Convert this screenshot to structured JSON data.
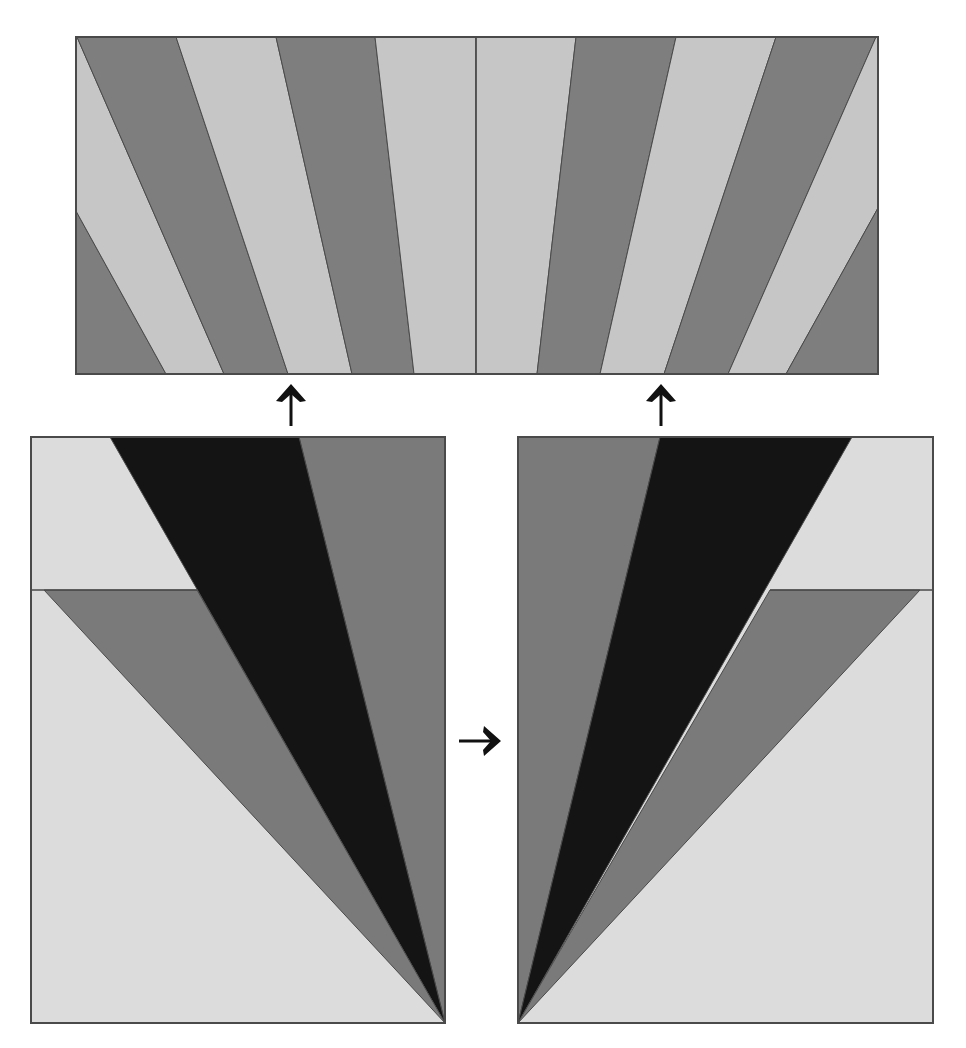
{
  "diagram": {
    "colors": {
      "background": "#ffffff",
      "stripe_light": "#c6c6c6",
      "stripe_dark": "#7e7e7e",
      "block_light": "#dcdcdc",
      "block_mid": "#7a7a7a",
      "block_black": "#141414",
      "outline": "#4a4a4a",
      "arrow": "#111111"
    },
    "top_panel": {
      "name": "sunburst-strip",
      "x": 76,
      "y": 37,
      "width": 802,
      "height": 337,
      "center_line_x": 476,
      "stripes": [
        {
          "tone": "dark",
          "points": "76,211 166,374 76,374"
        },
        {
          "tone": "light",
          "points": "76,37 77,37 224,374 166,374 76,211"
        },
        {
          "tone": "dark",
          "points": "77,37 176,37 288,374 224,374"
        },
        {
          "tone": "light",
          "points": "176,37 276,37 352,374 288,374"
        },
        {
          "tone": "dark",
          "points": "276,37 375,37 414,374 352,374"
        },
        {
          "tone": "light",
          "points": "375,37 476,37 476,374 414,374"
        },
        {
          "tone": "light",
          "points": "476,37 576,37 537,374 476,374"
        },
        {
          "tone": "dark",
          "points": "576,37 676,37 600,374 537,374"
        },
        {
          "tone": "light",
          "points": "676,37 776,37 664,374 600,374"
        },
        {
          "tone": "dark",
          "points": "776,37 876,37 728,374 664,374"
        },
        {
          "tone": "light",
          "points": "876,37 878,37 878,208 786,374 728,374"
        },
        {
          "tone": "dark",
          "points": "878,208 878,374 786,374"
        }
      ]
    },
    "left_block": {
      "name": "left-fan-block",
      "x": 31,
      "y": 437,
      "width": 414,
      "height": 586,
      "apex": "445,1023",
      "seam_y": 590,
      "shapes": [
        {
          "tone": "light",
          "label": "background",
          "points": "31,437 445,437 445,1023 31,1023"
        },
        {
          "tone": "mid",
          "label": "right-wedge",
          "points": "299,437 445,437 445,1023"
        },
        {
          "tone": "black",
          "label": "center-wedge",
          "points": "110,437 299,437 445,1023"
        },
        {
          "tone": "mid",
          "label": "lower-wedge",
          "points": "44,590 197,590 445,1023"
        }
      ],
      "seam_line": "31,590 197,590"
    },
    "right_block": {
      "name": "right-fan-block",
      "x": 518,
      "y": 437,
      "width": 415,
      "height": 586,
      "apex": "518,1023",
      "seam_y": 590,
      "shapes": [
        {
          "tone": "light",
          "label": "background",
          "points": "518,437 933,437 933,1023 518,1023"
        },
        {
          "tone": "mid",
          "label": "left-wedge",
          "points": "518,437 660,437 518,1023"
        },
        {
          "tone": "black",
          "label": "center-wedge",
          "points": "660,437 852,437 518,1023"
        },
        {
          "tone": "mid",
          "label": "lower-wedge",
          "points": "770,590 920,590 518,1023"
        }
      ],
      "seam_line": "770,590 933,590"
    },
    "arrows": [
      {
        "name": "up-arrow-left",
        "direction": "up",
        "x": 291,
        "y1": 426,
        "y2": 384
      },
      {
        "name": "up-arrow-right",
        "direction": "up",
        "x": 661,
        "y1": 426,
        "y2": 384
      },
      {
        "name": "right-arrow",
        "direction": "right",
        "y": 741,
        "x1": 459,
        "x2": 501
      }
    ]
  }
}
